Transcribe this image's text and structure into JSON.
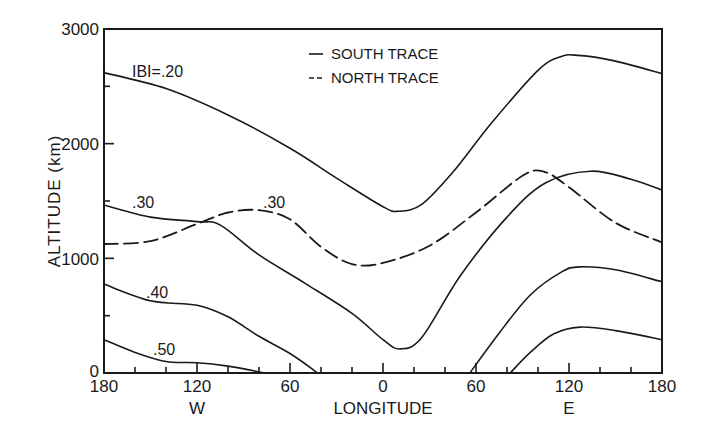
{
  "chart_data": {
    "type": "line",
    "title": "",
    "xlabel": "LONGITUDE",
    "ylabel": "ALTITUDE (km)",
    "xlim": [
      -180,
      180
    ],
    "ylim": [
      0,
      3000
    ],
    "x_ticks": [
      -180,
      -120,
      -60,
      0,
      60,
      120,
      180
    ],
    "x_tick_labels": [
      "180",
      "120",
      "60",
      "0",
      "60",
      "120",
      "180"
    ],
    "x_direction_labels": {
      "west": "W",
      "east": "E"
    },
    "y_ticks": [
      0,
      1000,
      2000,
      3000
    ],
    "y_tick_labels": [
      "0",
      "1000",
      "2000",
      "3000"
    ],
    "grid": false,
    "legend": {
      "position": "top-center",
      "entries": [
        {
          "style": "solid",
          "label": "SOUTH TRACE"
        },
        {
          "style": "dashed",
          "label": "NORTH TRACE"
        }
      ]
    },
    "annotations": [
      "IBI=.20",
      ".30",
      ".30",
      ".40",
      ".50"
    ],
    "series": [
      {
        "name": "|B|=.20 south trace",
        "style": "solid",
        "label": "IBI=.20",
        "x": [
          -180,
          -140,
          -100,
          -60,
          -30,
          0,
          10,
          25,
          45,
          70,
          100,
          115,
          126,
          150,
          180
        ],
        "y": [
          2620,
          2480,
          2250,
          1960,
          1700,
          1450,
          1410,
          1470,
          1750,
          2180,
          2640,
          2760,
          2770,
          2720,
          2610
        ]
      },
      {
        "name": "|B|=.30 south trace",
        "style": "solid",
        "label": ".30",
        "x": [
          -180,
          -150,
          -120,
          -105,
          -80,
          -50,
          -20,
          0,
          11,
          25,
          50,
          80,
          105,
          134,
          160,
          180
        ],
        "y": [
          1465,
          1360,
          1320,
          1290,
          1030,
          780,
          520,
          290,
          210,
          310,
          850,
          1360,
          1660,
          1760,
          1690,
          1595
        ],
        "gap_note": ""
      },
      {
        "name": "|B|=.40 south trace (west segment)",
        "style": "solid",
        "label": ".40",
        "x": [
          -180,
          -150,
          -120,
          -100,
          -80,
          -60,
          -42
        ],
        "y": [
          775,
          630,
          590,
          490,
          320,
          170,
          0
        ]
      },
      {
        "name": "|B|=.40 south trace (east segment)",
        "style": "solid",
        "x": [
          56,
          75,
          95,
          115,
          127,
          150,
          180
        ],
        "y": [
          0,
          350,
          680,
          880,
          925,
          900,
          795
        ]
      },
      {
        "name": "|B|=.50 south trace (west segment)",
        "style": "solid",
        "label": ".50",
        "x": [
          -180,
          -160,
          -140,
          -120,
          -100,
          -76
        ],
        "y": [
          290,
          180,
          100,
          90,
          60,
          0
        ]
      },
      {
        "name": "|B|=.50 south trace (east segment)",
        "style": "solid",
        "x": [
          82,
          95,
          110,
          127,
          150,
          180
        ],
        "y": [
          0,
          180,
          340,
          400,
          370,
          290
        ]
      },
      {
        "name": "|B|=.30 north trace",
        "style": "dashed",
        "label": ".30",
        "x": [
          -180,
          -150,
          -120,
          -100,
          -80,
          -60,
          -40,
          -20,
          0,
          30,
          60,
          90,
          104,
          120,
          150,
          180
        ],
        "y": [
          1125,
          1150,
          1300,
          1400,
          1420,
          1340,
          1100,
          950,
          960,
          1110,
          1400,
          1720,
          1755,
          1620,
          1310,
          1140
        ]
      }
    ]
  },
  "axes": {
    "y_label": "ALTITUDE (km)",
    "x_label": "LONGITUDE",
    "west_label": "W",
    "east_label": "E",
    "y_tick_labels": [
      "0",
      "1000",
      "2000",
      "3000"
    ],
    "x_tick_labels": [
      "180",
      "120",
      "60",
      "0",
      "60",
      "120",
      "180"
    ]
  },
  "legend": {
    "south": "SOUTH TRACE",
    "north": "NORTH TRACE",
    "south_symbol": "—",
    "north_symbol": "--"
  },
  "curve_labels": {
    "b20": "IBI=.20",
    "b30_south": ".30",
    "b30_north": ".30",
    "b40": ".40",
    "b50": ".50"
  }
}
